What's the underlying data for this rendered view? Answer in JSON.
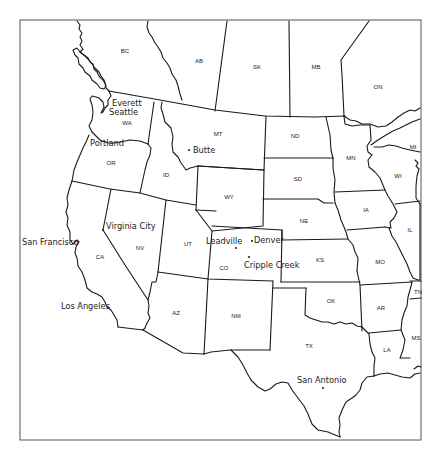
{
  "map": {
    "title": "Western United States and Canada",
    "frame": {
      "x": 20,
      "y": 20,
      "width": 401,
      "height": 420
    },
    "line_color": "#1a1a1a",
    "background": "#ffffff",
    "regions": [
      {
        "abbr": "BC",
        "x": 125,
        "y": 53
      },
      {
        "abbr": "AB",
        "x": 199,
        "y": 63
      },
      {
        "abbr": "SK",
        "x": 257,
        "y": 69
      },
      {
        "abbr": "MB",
        "x": 316,
        "y": 69
      },
      {
        "abbr": "ON",
        "x": 378,
        "y": 89
      },
      {
        "abbr": "WA",
        "x": 127,
        "y": 125
      },
      {
        "abbr": "OR",
        "x": 111,
        "y": 165
      },
      {
        "abbr": "ID",
        "x": 166,
        "y": 177
      },
      {
        "abbr": "MT",
        "x": 218,
        "y": 136
      },
      {
        "abbr": "ND",
        "x": 295,
        "y": 138
      },
      {
        "abbr": "SD",
        "x": 298,
        "y": 181
      },
      {
        "abbr": "WY",
        "x": 229,
        "y": 199
      },
      {
        "abbr": "MN",
        "x": 351,
        "y": 160
      },
      {
        "abbr": "WI",
        "x": 398,
        "y": 178
      },
      {
        "abbr": "MI",
        "x": 413,
        "y": 149
      },
      {
        "abbr": "NE",
        "x": 304,
        "y": 223
      },
      {
        "abbr": "IA",
        "x": 366,
        "y": 212
      },
      {
        "abbr": "IL",
        "x": 410,
        "y": 232
      },
      {
        "abbr": "NV",
        "x": 140,
        "y": 250
      },
      {
        "abbr": "UT",
        "x": 188,
        "y": 246
      },
      {
        "abbr": "CO",
        "x": 224,
        "y": 270
      },
      {
        "abbr": "KS",
        "x": 320,
        "y": 262
      },
      {
        "abbr": "MO",
        "x": 380,
        "y": 264
      },
      {
        "abbr": "CA",
        "x": 100,
        "y": 259
      },
      {
        "abbr": "AZ",
        "x": 176,
        "y": 315
      },
      {
        "abbr": "NM",
        "x": 236,
        "y": 318
      },
      {
        "abbr": "OK",
        "x": 331,
        "y": 303
      },
      {
        "abbr": "AR",
        "x": 381,
        "y": 310
      },
      {
        "abbr": "TN",
        "x": 418,
        "y": 294
      },
      {
        "abbr": "MS",
        "x": 416,
        "y": 340
      },
      {
        "abbr": "TX",
        "x": 309,
        "y": 348
      },
      {
        "abbr": "LA",
        "x": 387,
        "y": 352
      }
    ],
    "cities": [
      {
        "name": "Everett",
        "x": 112,
        "y": 106,
        "dot": false
      },
      {
        "name": "Seattle",
        "x": 109,
        "y": 115,
        "dot": false
      },
      {
        "name": "Portland",
        "x": 90,
        "y": 146,
        "dot": false
      },
      {
        "name": "Butte",
        "x": 193,
        "y": 153,
        "dot": true,
        "dx": 189,
        "dy": 150
      },
      {
        "name": "Virginia City",
        "x": 106,
        "y": 229,
        "dot": true,
        "dx": 103,
        "dy": 230
      },
      {
        "name": "San Francisco",
        "x": 22,
        "y": 245,
        "dot": false
      },
      {
        "name": "Leadville",
        "x": 206,
        "y": 244,
        "dot": true,
        "dx": 236,
        "dy": 248
      },
      {
        "name": "Denver",
        "x": 254,
        "y": 243,
        "dot": true,
        "dx": 252,
        "dy": 241
      },
      {
        "name": "Cripple Creek",
        "x": 244,
        "y": 268,
        "dot": true,
        "dx": 249,
        "dy": 257
      },
      {
        "name": "Los Angeles",
        "x": 61,
        "y": 309,
        "dot": false
      },
      {
        "name": "San Antonio",
        "x": 297,
        "y": 383,
        "dot": true,
        "dx": 323,
        "dy": 388
      }
    ]
  }
}
